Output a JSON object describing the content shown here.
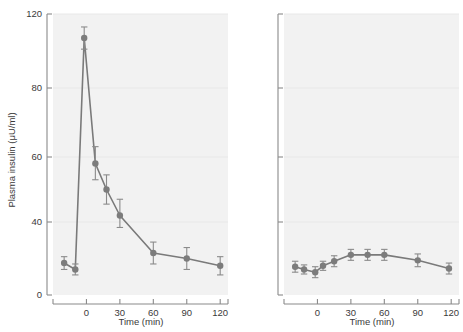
{
  "figure": {
    "type": "two-panel-line-chart",
    "background_color": "#ffffff",
    "plot_background_color": "#f2f2f2",
    "series_color": "#7c7c7c",
    "axis_color": "#8a8a8a",
    "grid_color": "#e6e6e6"
  },
  "chart_data": [
    {
      "type": "line",
      "panel": "left",
      "title": "",
      "xlabel": "Time (min)",
      "ylabel": "Plasma insulin (μU/ml)",
      "xlim": [
        -30,
        127
      ],
      "ylim": [
        0,
        120
      ],
      "xticks": [
        0,
        30,
        60,
        90,
        120
      ],
      "xticklabels": [
        "0",
        "30",
        "60",
        "90",
        "120"
      ],
      "yticks": [
        0,
        40,
        60,
        80,
        120
      ],
      "yticklabels": [
        "0",
        "40",
        "60",
        "80",
        "120"
      ],
      "grid": true,
      "legend": "none",
      "error_type": "SEM",
      "series": [
        {
          "name": "Plasma insulin",
          "x": [
            -20,
            -10,
            -2,
            8,
            18,
            30,
            60,
            90,
            120
          ],
          "values": [
            17.5,
            14.0,
            107.0,
            58.0,
            50.0,
            42.0,
            23.0,
            20.0,
            16.0
          ],
          "errors": [
            3.5,
            3.0,
            6.0,
            5.0,
            4.5,
            5.0,
            6.0,
            6.0,
            5.0
          ]
        }
      ]
    },
    {
      "type": "line",
      "panel": "right",
      "title": "",
      "xlabel": "Time (min)",
      "ylabel": "",
      "xlim": [
        -30,
        127
      ],
      "ylim": [
        0,
        120
      ],
      "xticks": [
        0,
        30,
        60,
        90,
        120
      ],
      "xticklabels": [
        "0",
        "30",
        "60",
        "90",
        "120"
      ],
      "yticks": [
        0,
        40,
        60,
        80,
        120
      ],
      "yticklabels": [
        "",
        "",
        "",
        "",
        ""
      ],
      "grid": true,
      "legend": "none",
      "error_type": "SEM",
      "series": [
        {
          "name": "Plasma insulin",
          "x": [
            -20,
            -12,
            -2,
            5,
            15,
            30,
            45,
            60,
            90,
            118
          ],
          "values": [
            15.5,
            14.0,
            12.5,
            16.0,
            18.5,
            22.0,
            22.0,
            22.0,
            19.0,
            14.5
          ],
          "errors": [
            3.0,
            2.5,
            3.0,
            2.5,
            3.0,
            3.0,
            3.0,
            3.0,
            3.5,
            3.0
          ]
        }
      ]
    }
  ],
  "labels": {
    "y_axis_title": "Plasma insulin (μU/ml)",
    "x_axis_title_left": "Time (min)",
    "x_axis_title_right": "Time (min)"
  }
}
